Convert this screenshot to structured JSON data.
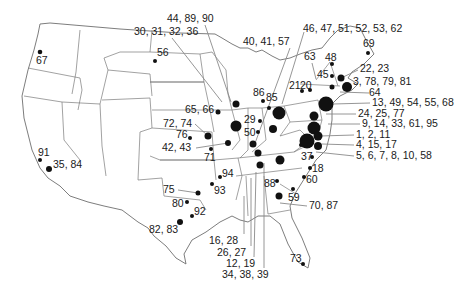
{
  "map": {
    "region": "Contiguous United States",
    "colors": {
      "dot": "#111111",
      "state_border": "#7a7a7a",
      "leader_line": "#8a8a8a",
      "background": "#ffffff"
    }
  },
  "sites": [
    {
      "label": "67",
      "x": 40,
      "y": 52,
      "r": 2.3,
      "lx": 36,
      "ly": 64
    },
    {
      "label": "56",
      "x": 155,
      "y": 61,
      "r": 2.0,
      "lx": 157,
      "ly": 56
    },
    {
      "label": "30, 31, 32, 36",
      "x": 222,
      "y": 102,
      "r": 0,
      "lx": 134,
      "ly": 35
    },
    {
      "label": "44, 89, 90",
      "x": 231,
      "y": 102,
      "r": 0,
      "lx": 167,
      "ly": 22
    },
    {
      "label": "40, 41, 57",
      "x": 254,
      "y": 146,
      "r": 0,
      "lx": 243,
      "ly": 45
    },
    {
      "label": "46, 47, 51, 52, 53, 62",
      "x": 282,
      "y": 104,
      "r": 0,
      "lx": 303,
      "ly": 32
    },
    {
      "label": "69",
      "x": 368,
      "y": 53,
      "r": 2.0,
      "lx": 363,
      "ly": 47
    },
    {
      "label": "63",
      "x": 316,
      "y": 79,
      "r": 0,
      "lx": 304,
      "ly": 60
    },
    {
      "label": "48",
      "x": 332,
      "y": 64,
      "r": 2.0,
      "lx": 325,
      "ly": 61
    },
    {
      "label": "22, 23",
      "x": 341,
      "y": 78,
      "r": 0,
      "lx": 360,
      "ly": 72
    },
    {
      "label": "45",
      "x": 332,
      "y": 76,
      "r": 2.0,
      "lx": 317,
      "ly": 78
    },
    {
      "label": "21",
      "x": 302,
      "y": 91,
      "r": 2.0,
      "lx": 289,
      "ly": 89
    },
    {
      "label": "20",
      "x": 310,
      "y": 90,
      "r": 2.0,
      "lx": 300,
      "ly": 89
    },
    {
      "label": "3, 78, 79, 81",
      "x": 347,
      "y": 87,
      "r": 5.0,
      "lx": 353,
      "ly": 85
    },
    {
      "label": "64",
      "x": 340,
      "y": 92,
      "r": 0,
      "lx": 369,
      "ly": 96
    },
    {
      "label": "13, 49, 54, 55, 68",
      "x": 333,
      "y": 104,
      "r": 0,
      "lx": 372,
      "ly": 106
    },
    {
      "label": "24, 25, 77",
      "x": 326,
      "y": 114,
      "r": 0,
      "lx": 358,
      "ly": 117
    },
    {
      "label": "9, 14, 33, 61, 95",
      "x": 328,
      "y": 124,
      "r": 0,
      "lx": 362,
      "ly": 127
    },
    {
      "label": "1, 2, 11",
      "x": 320,
      "y": 136,
      "r": 0,
      "lx": 356,
      "ly": 138
    },
    {
      "label": "4, 15, 17",
      "x": 322,
      "y": 144,
      "r": 0,
      "lx": 356,
      "ly": 148
    },
    {
      "label": "5, 6, 7, 8, 10, 58",
      "x": 316,
      "y": 152,
      "r": 0,
      "lx": 356,
      "ly": 159
    },
    {
      "label": "37",
      "x": 312,
      "y": 157,
      "r": 2.0,
      "lx": 301,
      "ly": 160
    },
    {
      "label": "18",
      "x": 310,
      "y": 168,
      "r": 2.0,
      "lx": 312,
      "ly": 172
    },
    {
      "label": "60",
      "x": 304,
      "y": 177,
      "r": 2.0,
      "lx": 306,
      "ly": 183
    },
    {
      "label": "59",
      "x": 293,
      "y": 189,
      "r": 2.0,
      "lx": 288,
      "ly": 201
    },
    {
      "label": "70, 87",
      "x": 280,
      "y": 203,
      "r": 0,
      "lx": 309,
      "ly": 209
    },
    {
      "label": "88",
      "x": 277,
      "y": 181,
      "r": 2.0,
      "lx": 264,
      "ly": 187
    },
    {
      "label": "73",
      "x": 303,
      "y": 264,
      "r": 2.0,
      "lx": 290,
      "ly": 262
    },
    {
      "label": "86",
      "x": 263,
      "y": 101,
      "r": 2.0,
      "lx": 253,
      "ly": 96
    },
    {
      "label": "85",
      "x": 269,
      "y": 108,
      "r": 2.0,
      "lx": 266,
      "ly": 101
    },
    {
      "label": "29",
      "x": 260,
      "y": 121,
      "r": 2.0,
      "lx": 244,
      "ly": 123
    },
    {
      "label": "50",
      "x": 258,
      "y": 132,
      "r": 2.0,
      "lx": 244,
      "ly": 136
    },
    {
      "label": "65, 66",
      "x": 218,
      "y": 112,
      "r": 2.5,
      "lx": 185,
      "ly": 113
    },
    {
      "label": "72, 74",
      "x": 208,
      "y": 136,
      "r": 0,
      "lx": 163,
      "ly": 127
    },
    {
      "label": "76",
      "x": 190,
      "y": 138,
      "r": 2.0,
      "lx": 176,
      "ly": 138
    },
    {
      "label": "42, 43",
      "x": 228,
      "y": 143,
      "r": 0,
      "lx": 162,
      "ly": 151
    },
    {
      "label": "71",
      "x": 211,
      "y": 149,
      "r": 2.0,
      "lx": 204,
      "ly": 161
    },
    {
      "label": "94",
      "x": 220,
      "y": 177,
      "r": 2.0,
      "lx": 222,
      "ly": 177
    },
    {
      "label": "93",
      "x": 212,
      "y": 184,
      "r": 2.0,
      "lx": 214,
      "ly": 194
    },
    {
      "label": "75",
      "x": 198,
      "y": 193,
      "r": 0,
      "lx": 163,
      "ly": 193
    },
    {
      "label": "80",
      "x": 187,
      "y": 202,
      "r": 2.0,
      "lx": 172,
      "ly": 207
    },
    {
      "label": "92",
      "x": 192,
      "y": 216,
      "r": 2.0,
      "lx": 194,
      "ly": 215
    },
    {
      "label": "82, 83",
      "x": 180,
      "y": 222,
      "r": 3.0,
      "lx": 149,
      "ly": 233
    },
    {
      "label": "91",
      "x": 40,
      "y": 160,
      "r": 2.0,
      "lx": 38,
      "ly": 156
    },
    {
      "label": "35, 84",
      "x": 49,
      "y": 169,
      "r": 3.0,
      "lx": 53,
      "ly": 168
    },
    {
      "label": "16, 28",
      "x": 244,
      "y": 196,
      "r": 0,
      "lx": 209,
      "ly": 244
    },
    {
      "label": "26, 27",
      "x": 251,
      "y": 178,
      "r": 0,
      "lx": 217,
      "ly": 256
    },
    {
      "label": "12, 19",
      "x": 256,
      "y": 172,
      "r": 0,
      "lx": 226,
      "ly": 267
    },
    {
      "label": "34, 38, 39",
      "x": 264,
      "y": 163,
      "r": 0,
      "lx": 222,
      "ly": 278
    }
  ],
  "dots_unlabeled": [
    {
      "x": 236,
      "y": 104,
      "r": 3.5
    },
    {
      "x": 236,
      "y": 126,
      "r": 5.5
    },
    {
      "x": 208,
      "y": 136,
      "r": 3.5
    },
    {
      "x": 228,
      "y": 143,
      "r": 3.0
    },
    {
      "x": 253,
      "y": 144,
      "r": 3.5
    },
    {
      "x": 258,
      "y": 153,
      "r": 3.5
    },
    {
      "x": 279,
      "y": 113,
      "r": 6.5
    },
    {
      "x": 273,
      "y": 129,
      "r": 4.0
    },
    {
      "x": 260,
      "y": 165,
      "r": 3.5
    },
    {
      "x": 280,
      "y": 160,
      "r": 4.5
    },
    {
      "x": 279,
      "y": 196,
      "r": 3.5
    },
    {
      "x": 301,
      "y": 145,
      "r": 2.0
    },
    {
      "x": 332,
      "y": 87,
      "r": 2.5
    },
    {
      "x": 326,
      "y": 104,
      "r": 7.5
    },
    {
      "x": 314,
      "y": 116,
      "r": 4.5
    },
    {
      "x": 314,
      "y": 128,
      "r": 6.5
    },
    {
      "x": 318,
      "y": 136,
      "r": 4.5
    },
    {
      "x": 307,
      "y": 141,
      "r": 7.5
    },
    {
      "x": 318,
      "y": 146,
      "r": 4.0
    },
    {
      "x": 208,
      "y": 175,
      "r": 0
    },
    {
      "x": 198,
      "y": 193,
      "r": 2.5
    },
    {
      "x": 341,
      "y": 78,
      "r": 3.5
    }
  ]
}
